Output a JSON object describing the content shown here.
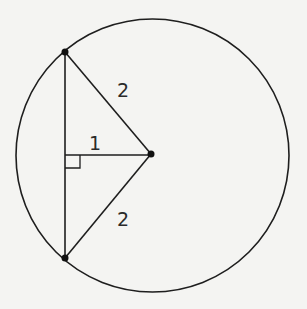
{
  "diagram": {
    "type": "circle-chord-geometry",
    "circle": {
      "cx": 152.5,
      "cy": 155.5,
      "r": 136.5
    },
    "center_point": {
      "x": 151,
      "y": 154
    },
    "chord_endpoints": [
      {
        "x": 65,
        "y": 52
      },
      {
        "x": 65,
        "y": 258
      }
    ],
    "perpendicular_foot": {
      "x": 65,
      "y": 155
    },
    "labels": {
      "upper_radius": "2",
      "perpendicular_distance": "1",
      "lower_radius": "2"
    },
    "colors": {
      "stroke": "#1e1e1e",
      "background": "#f4f4f2"
    }
  }
}
